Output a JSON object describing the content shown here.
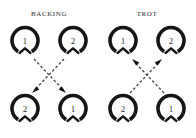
{
  "figure": {
    "background_color": "#ffffff",
    "ink_color": "#161616",
    "panels": [
      {
        "id": "backing",
        "title": "Backing",
        "arrow_direction": "down",
        "nodes": [
          {
            "position": "top-left",
            "label": "1"
          },
          {
            "position": "top-right",
            "label": "2"
          },
          {
            "position": "bottom-left",
            "label": "2"
          },
          {
            "position": "bottom-right",
            "label": "1"
          }
        ],
        "links": [
          {
            "from": "top-left",
            "to": "bottom-right",
            "style": "dashed",
            "arrowhead": "at-end"
          },
          {
            "from": "top-right",
            "to": "bottom-left",
            "style": "dashed",
            "arrowhead": "at-end"
          }
        ]
      },
      {
        "id": "trot",
        "title": "Trot",
        "arrow_direction": "up",
        "nodes": [
          {
            "position": "top-left",
            "label": "1"
          },
          {
            "position": "top-right",
            "label": "2"
          },
          {
            "position": "bottom-left",
            "label": "2"
          },
          {
            "position": "bottom-right",
            "label": "1"
          }
        ],
        "links": [
          {
            "from": "bottom-left",
            "to": "top-right",
            "style": "dashed",
            "arrowhead": "at-end"
          },
          {
            "from": "bottom-right",
            "to": "top-left",
            "style": "dashed",
            "arrowhead": "at-end"
          }
        ]
      }
    ]
  }
}
